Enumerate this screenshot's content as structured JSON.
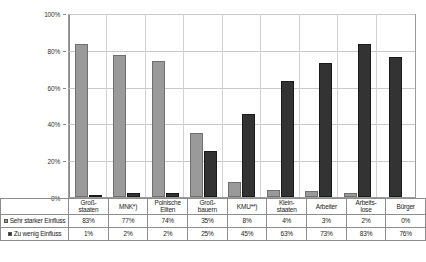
{
  "chart_data": {
    "type": "bar",
    "title": "",
    "xlabel": "",
    "ylabel": "",
    "ylim": [
      0,
      100
    ],
    "yticks": [
      "0%",
      "20%",
      "40%",
      "60%",
      "80%",
      "100%"
    ],
    "grid": true,
    "legend_position": "table-left",
    "categories": [
      "Groß-\nstaaten",
      "MNK*)",
      "Polnische\nEliten",
      "Groß-\nbauern",
      "KMU**)",
      "Klein-\nstaaten",
      "Arbeiter",
      "Arbeits-\nlose",
      "Bürger"
    ],
    "series": [
      {
        "name": "Sehr starker Einfluss",
        "color": "#9a9a9a",
        "values": [
          83,
          77,
          74,
          35,
          8,
          4,
          3,
          2,
          0
        ],
        "labels": [
          "83%",
          "77%",
          "74%",
          "35%",
          "8%",
          "4%",
          "3%",
          "2%",
          "0%"
        ]
      },
      {
        "name": "Zu wenig Einfluss",
        "color": "#333333",
        "values": [
          1,
          2,
          2,
          25,
          45,
          63,
          73,
          83,
          76
        ],
        "labels": [
          "1%",
          "2%",
          "2%",
          "25%",
          "45%",
          "63%",
          "73%",
          "83%",
          "76%"
        ]
      }
    ]
  }
}
